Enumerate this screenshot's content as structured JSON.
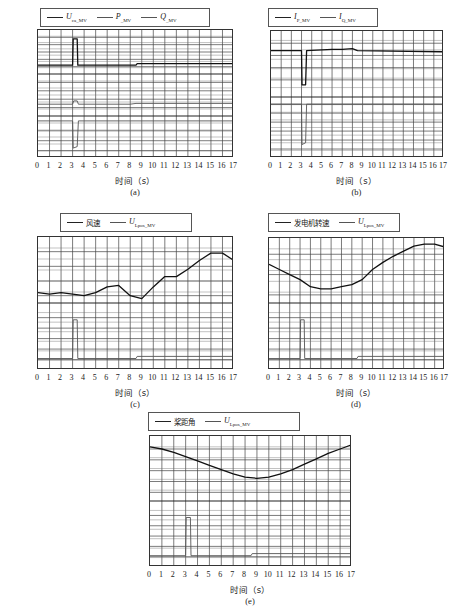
{
  "figure": {
    "xtitle": "时间（s）",
    "xticks": [
      "0",
      "1",
      "2",
      "3",
      "4",
      "5",
      "6",
      "7",
      "8",
      "9",
      "10",
      "11",
      "12",
      "13",
      "14",
      "15",
      "16",
      "17"
    ]
  },
  "panels": [
    {
      "id": "a",
      "caption": "(a)",
      "legend": [
        {
          "base": "U",
          "sub": "ca_MV",
          "style": "thick"
        },
        {
          "base": "P",
          "sub": "_MV",
          "style": "thin"
        },
        {
          "base": "Q",
          "sub": "_MV",
          "style": "thin"
        }
      ]
    },
    {
      "id": "b",
      "caption": "(b)",
      "legend": [
        {
          "base": "I",
          "sub": "P_MV",
          "style": "thick"
        },
        {
          "base": "I",
          "sub": "Q_MV",
          "style": "thin"
        }
      ]
    },
    {
      "id": "c",
      "caption": "(c)",
      "legend": [
        {
          "text": "风速",
          "style": "thick"
        },
        {
          "base": "U",
          "sub": "Lpos_MV",
          "style": "thin"
        }
      ]
    },
    {
      "id": "d",
      "caption": "(d)",
      "legend": [
        {
          "text": "发电机转速",
          "style": "thick"
        },
        {
          "base": "U",
          "sub": "Lpos_MV",
          "style": "thin"
        }
      ]
    },
    {
      "id": "e",
      "caption": "(e)",
      "legend": [
        {
          "text": "桨距角",
          "style": "thick"
        },
        {
          "base": "U",
          "sub": "Lpos_MV",
          "style": "thin"
        }
      ]
    }
  ],
  "chart_data": [
    {
      "type": "line",
      "panel": "(a)",
      "xlabel": "时间（s）",
      "xlim": [
        0,
        17
      ],
      "subplots": [
        {
          "ylabel": "U/U_b",
          "yticks": [
            "1.25",
            "1.20",
            "1.15",
            "1.10",
            "1.05"
          ],
          "series": [
            {
              "name": "U_ca_MV",
              "x": [
                0,
                3,
                3.05,
                3.4,
                3.45,
                8.5,
                8.6,
                17
              ],
              "y": [
                1.06,
                1.06,
                1.24,
                1.24,
                1.06,
                1.06,
                1.07,
                1.07
              ]
            }
          ]
        },
        {
          "ylabel": "P/S_b",
          "yticks": [
            "1.15",
            "1.10",
            "1.05",
            "1.00"
          ],
          "series": [
            {
              "name": "P_MV",
              "x": [
                0,
                3,
                3.1,
                3.4,
                3.5,
                8,
                8.5,
                17
              ],
              "y": [
                1.02,
                1.02,
                1.04,
                1.04,
                1.02,
                1.02,
                1.025,
                1.025
              ]
            }
          ]
        },
        {
          "ylabel": "Q/S_b",
          "yticks": [
            "-0.2",
            "-0.4",
            "-0.6"
          ],
          "series": [
            {
              "name": "Q_MV",
              "x": [
                0,
                3,
                3.05,
                3.4,
                3.5,
                17
              ],
              "y": [
                0,
                0,
                -0.55,
                -0.52,
                0,
                0
              ]
            }
          ]
        }
      ]
    },
    {
      "type": "line",
      "panel": "(b)",
      "xlabel": "时间（s）",
      "xlim": [
        0,
        17
      ],
      "subplots": [
        {
          "ylabel": "I/I_b",
          "yticks": [
            "1.00",
            "0.95",
            "0.90",
            "0.85"
          ],
          "series": [
            {
              "name": "I_P_MV",
              "x": [
                0,
                3,
                3.05,
                3.4,
                3.5,
                6,
                7,
                8,
                8.5,
                17
              ],
              "y": [
                0.97,
                0.97,
                0.83,
                0.83,
                0.97,
                0.975,
                0.975,
                0.978,
                0.97,
                0.965
              ]
            }
          ]
        },
        {
          "ylabel": "I/I_b",
          "yticks": [
            "0.0",
            "-0.1",
            "-0.2",
            "-0.3",
            "-0.4",
            "-0.5"
          ],
          "series": [
            {
              "name": "I_Q_MV",
              "x": [
                0,
                3,
                3.05,
                3.4,
                3.5,
                17
              ],
              "y": [
                0,
                0,
                -0.45,
                -0.43,
                0,
                0
              ]
            }
          ]
        }
      ]
    },
    {
      "type": "line",
      "panel": "(c)",
      "xlabel": "时间（s）",
      "xlim": [
        0,
        17
      ],
      "subplots": [
        {
          "ylabel": "m/s",
          "yticks": [
            "9.5",
            "9.0",
            "8.5",
            "8.0"
          ],
          "series": [
            {
              "name": "风速",
              "x": [
                0,
                1,
                2,
                3,
                4,
                5,
                6,
                7,
                8,
                9,
                10,
                11,
                12,
                13,
                14,
                15,
                16,
                17
              ],
              "y": [
                8.1,
                8.05,
                8.1,
                8.05,
                8.0,
                8.1,
                8.3,
                8.35,
                8.0,
                7.9,
                8.3,
                8.65,
                8.65,
                8.9,
                9.2,
                9.45,
                9.45,
                9.2
              ]
            }
          ]
        },
        {
          "ylabel": "U/U_b",
          "yticks": [
            "1.25",
            "1.20",
            "1.15",
            "1.10",
            "1.05"
          ],
          "series": [
            {
              "name": "U_Lpos_MV",
              "x": [
                0,
                3,
                3.05,
                3.4,
                3.45,
                8.5,
                8.6,
                17
              ],
              "y": [
                1.055,
                1.055,
                1.24,
                1.24,
                1.055,
                1.055,
                1.065,
                1.065
              ]
            }
          ]
        }
      ]
    },
    {
      "type": "line",
      "panel": "(d)",
      "xlabel": "时间（s）",
      "xlim": [
        0,
        17
      ],
      "subplots": [
        {
          "ylabel": "r/min",
          "yticks": [
            "14.2",
            "14.0",
            "13.8"
          ],
          "series": [
            {
              "name": "发电机转速",
              "x": [
                0,
                1,
                2,
                3,
                4,
                5,
                6,
                7,
                8,
                9,
                10,
                11,
                12,
                13,
                14,
                15,
                16,
                17
              ],
              "y": [
                14.1,
                14.05,
                14.0,
                13.95,
                13.88,
                13.86,
                13.86,
                13.88,
                13.9,
                13.95,
                14.05,
                14.12,
                14.18,
                14.23,
                14.28,
                14.3,
                14.3,
                14.27
              ]
            }
          ]
        },
        {
          "ylabel": "U/U_b",
          "yticks": [
            "1.25",
            "1.20",
            "1.15",
            "1.10",
            "1.05"
          ],
          "series": [
            {
              "name": "U_Lpos_MV",
              "x": [
                0,
                3,
                3.05,
                3.4,
                3.45,
                8.5,
                8.6,
                17
              ],
              "y": [
                1.055,
                1.055,
                1.24,
                1.24,
                1.055,
                1.055,
                1.065,
                1.065
              ]
            }
          ]
        }
      ]
    },
    {
      "type": "line",
      "panel": "(e)",
      "xlabel": "时间（s）",
      "xlim": [
        0,
        17
      ],
      "subplots": [
        {
          "ylabel": "deg",
          "yticks": [
            "5",
            "4",
            "3",
            "2",
            "1"
          ],
          "series": [
            {
              "name": "桨距角",
              "x": [
                0,
                1,
                2,
                3,
                4,
                5,
                6,
                7,
                8,
                9,
                10,
                11,
                12,
                13,
                14,
                15,
                16,
                17
              ],
              "y": [
                5.2,
                5.0,
                4.7,
                4.3,
                3.9,
                3.5,
                3.1,
                2.7,
                2.4,
                2.3,
                2.4,
                2.7,
                3.1,
                3.6,
                4.1,
                4.6,
                5.0,
                5.4
              ]
            }
          ]
        },
        {
          "ylabel": "U/U_b",
          "yticks": [
            "1.25",
            "1.20",
            "1.15",
            "1.10",
            "1.05"
          ],
          "series": [
            {
              "name": "U_Lpos_MV",
              "x": [
                0,
                3,
                3.05,
                3.4,
                3.45,
                8.5,
                8.6,
                17
              ],
              "y": [
                1.055,
                1.055,
                1.24,
                1.24,
                1.055,
                1.055,
                1.065,
                1.065
              ]
            }
          ]
        }
      ]
    }
  ]
}
